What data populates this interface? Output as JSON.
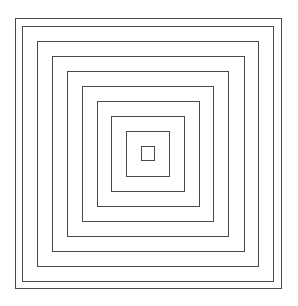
{
  "diagram": {
    "title": "",
    "type": "concentric-squares",
    "background": "#ffffff",
    "stroke_color": "#4a4a4a",
    "count": 10,
    "squares": [
      {
        "id": 1,
        "left": 15,
        "top": 18,
        "right": 282,
        "bottom": 289
      },
      {
        "id": 2,
        "left": 22,
        "top": 26,
        "right": 274,
        "bottom": 282
      },
      {
        "id": 3,
        "left": 37,
        "top": 41,
        "right": 259,
        "bottom": 267
      },
      {
        "id": 4,
        "left": 52,
        "top": 56,
        "right": 245,
        "bottom": 252
      },
      {
        "id": 5,
        "left": 67,
        "top": 71,
        "right": 229,
        "bottom": 237
      },
      {
        "id": 6,
        "left": 82,
        "top": 86,
        "right": 214,
        "bottom": 222
      },
      {
        "id": 7,
        "left": 97,
        "top": 101,
        "right": 200,
        "bottom": 207
      },
      {
        "id": 8,
        "left": 111,
        "top": 116,
        "right": 185,
        "bottom": 192
      },
      {
        "id": 9,
        "left": 126,
        "top": 131,
        "right": 170,
        "bottom": 177
      },
      {
        "id": 10,
        "left": 141,
        "top": 146,
        "right": 155,
        "bottom": 161
      }
    ]
  }
}
